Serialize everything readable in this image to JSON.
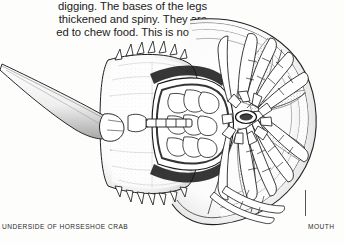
{
  "page": {
    "background_color": "#fdfdfc",
    "ink_color": "#1b1b1b",
    "width": 344,
    "height": 243
  },
  "body_text": {
    "line1": "digging. The bases of the legs",
    "line2": "thickened and spiny. They are",
    "line3": "ed to chew food. This is not as",
    "note": "left edge of the column is cropped off the page"
  },
  "captions": {
    "underside_label": "UNDERSIDE OF HORSESHOE CRAB",
    "mouth_label": "MOUTH"
  },
  "illustration": {
    "subject": "horseshoe crab underside",
    "style": "pen-and-ink stipple line engraving",
    "parts": [
      "telson-tail-spine",
      "opisthosoma-abdomen-with-marginal-spines",
      "prosoma-carapace-rim",
      "book-gills",
      "walking-legs",
      "gnathobases-leg-bases",
      "mouth-opening",
      "chelicerae"
    ],
    "line_color": "#1a1a1a",
    "fill_color": "#ffffff",
    "shade_color": "#9a9a9a"
  }
}
